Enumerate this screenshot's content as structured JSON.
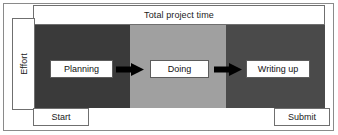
{
  "diagram": {
    "title_banner": "Total project time",
    "y_axis_label": "Effort",
    "phases": [
      {
        "label": "Planning",
        "band_color": "#3a3a3a"
      },
      {
        "label": "Doing",
        "band_color": "#a0a0a0"
      },
      {
        "label": "Writing up",
        "band_color": "#4a4a4a"
      }
    ],
    "connectors": [
      {
        "icon": "right-arrow-icon"
      },
      {
        "icon": "right-arrow-icon"
      }
    ],
    "milestones": {
      "start": "Start",
      "submit": "Submit"
    },
    "colors": {
      "background": "#ffffff",
      "frame": "#8a8a8a",
      "box_border": "#6f6f6f",
      "text": "#1a1a1a",
      "arrow": "#000000"
    }
  }
}
